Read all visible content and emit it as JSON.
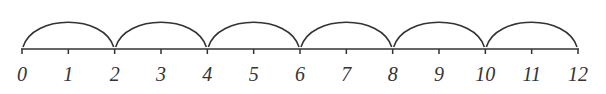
{
  "number_line": {
    "min": 0,
    "max": 12,
    "tick_labels": [
      "0",
      "1",
      "2",
      "3",
      "4",
      "5",
      "6",
      "7",
      "8",
      "9",
      "10",
      "11",
      "12"
    ],
    "jump_size": 2,
    "jumps": [
      {
        "from": 0,
        "to": 2
      },
      {
        "from": 2,
        "to": 4
      },
      {
        "from": 4,
        "to": 6
      },
      {
        "from": 6,
        "to": 8
      },
      {
        "from": 8,
        "to": 10
      },
      {
        "from": 10,
        "to": 12
      }
    ],
    "line_color": "#333333"
  }
}
